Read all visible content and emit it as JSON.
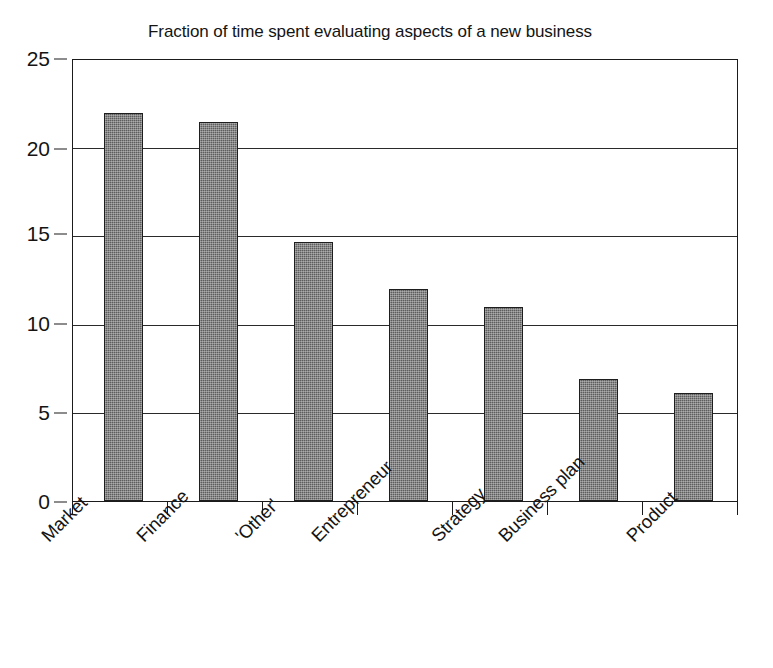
{
  "chart_data": {
    "type": "bar",
    "title": "Fraction of time spent evaluating aspects of a new business",
    "xlabel": "",
    "ylabel": "",
    "categories": [
      "Market",
      "Finance",
      "'Other'",
      "Entrepreneur",
      "Strategy",
      "Business plan",
      "Product"
    ],
    "values": [
      22.0,
      21.5,
      14.7,
      12.0,
      11.0,
      6.9,
      6.1
    ],
    "ylim": [
      0,
      25
    ],
    "yticks": [
      0,
      5,
      10,
      15,
      20,
      25
    ],
    "ytick_labels": [
      "0",
      "5",
      "10",
      "15",
      "20",
      "25"
    ],
    "grid": true,
    "grid_axis": "y",
    "legend": false,
    "legend_position": "none",
    "bar_color": "#5d5d5d",
    "bar_edge_color": "#1e1e1e",
    "axis_color": "#1b1b1b",
    "background_color": "#ffffff",
    "text_color": "#141414",
    "xtick_label_rotation": -45
  }
}
